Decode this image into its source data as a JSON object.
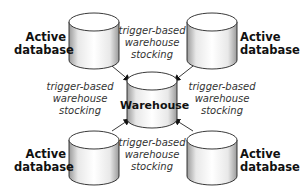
{
  "diagram": {
    "center": {
      "label": "Warehouse"
    },
    "sources": [
      {
        "position": "top-left",
        "label_line1": "Active",
        "label_line2": "database"
      },
      {
        "position": "top-right",
        "label_line1": "Active",
        "label_line2": "database"
      },
      {
        "position": "bottom-left",
        "label_line1": "Active",
        "label_line2": "database"
      },
      {
        "position": "bottom-right",
        "label_line1": "Active",
        "label_line2": "database"
      }
    ],
    "edge_labels": [
      {
        "position": "top",
        "line1": "trigger-based",
        "line2": "warehouse",
        "line3": "stocking"
      },
      {
        "position": "left",
        "line1": "trigger-based",
        "line2": "warehouse",
        "line3": "stocking"
      },
      {
        "position": "right",
        "line1": "trigger-based",
        "line2": "warehouse",
        "line3": "stocking"
      },
      {
        "position": "bottom",
        "line1": "trigger-based",
        "line2": "warehouse",
        "line3": "stocking"
      }
    ],
    "colors": {
      "stroke": "#222222",
      "cylinder_body": "#f2f2f2",
      "shade": "#9a9a9a"
    }
  }
}
